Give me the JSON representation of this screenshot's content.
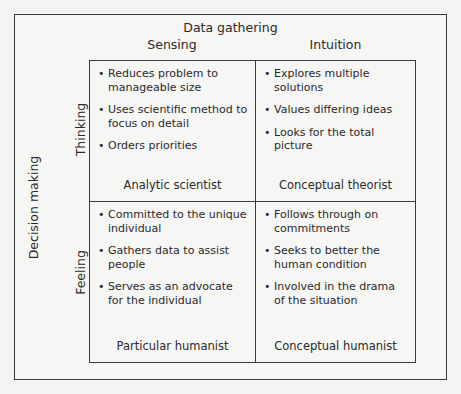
{
  "diagram": {
    "title": "Data gathering",
    "columns": [
      "Sensing",
      "Intuition"
    ],
    "side_title": "Decision making",
    "rows": [
      "Thinking",
      "Feeling"
    ],
    "bullet": "•",
    "cells": [
      {
        "row": "Thinking",
        "column": "Sensing",
        "title": "Analytic scientist",
        "items": [
          "Reduces problem to manageable size",
          "Uses scientific method to focus on detail",
          "Orders priorities"
        ]
      },
      {
        "row": "Thinking",
        "column": "Intuition",
        "title": "Conceptual theorist",
        "items": [
          "Explores multiple solutions",
          "Values differing ideas",
          "Looks for the total picture"
        ]
      },
      {
        "row": "Feeling",
        "column": "Sensing",
        "title": "Particular humanist",
        "items": [
          "Committed to the unique individual",
          "Gathers data to assist people",
          "Serves as an advocate for the individual"
        ]
      },
      {
        "row": "Feeling",
        "column": "Intuition",
        "title": "Conceptual humanist",
        "items": [
          "Follows through on commitments",
          "Seeks to better the human condition",
          "Involved in the drama of the situation"
        ]
      }
    ]
  }
}
